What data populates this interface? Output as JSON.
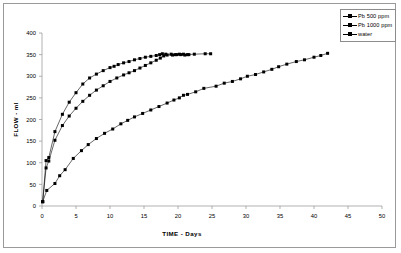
{
  "chart_data": {
    "type": "line",
    "title": "",
    "xlabel": "TIME  -  Days",
    "ylabel": "FLOW - ml",
    "xlim": [
      0,
      50
    ],
    "ylim": [
      0,
      400
    ],
    "xticks": [
      0,
      5,
      10,
      15,
      20,
      25,
      30,
      35,
      40,
      45,
      50
    ],
    "yticks": [
      0,
      50,
      100,
      150,
      200,
      250,
      300,
      350,
      400
    ],
    "grid": false,
    "legend_position": "top-right",
    "marker": "filled-square",
    "line_color": "#000000",
    "series": [
      {
        "name": "Pb 500 ppm",
        "points": [
          [
            0.1,
            10
          ],
          [
            0.6,
            105
          ],
          [
            1.0,
            112
          ],
          [
            1.9,
            172
          ],
          [
            3.0,
            212
          ],
          [
            4.0,
            240
          ],
          [
            5.0,
            262
          ],
          [
            6.0,
            282
          ],
          [
            7.0,
            296
          ],
          [
            8.0,
            305
          ],
          [
            9.0,
            313
          ],
          [
            10.0,
            320
          ],
          [
            10.6,
            323
          ],
          [
            11.2,
            327
          ],
          [
            12.0,
            331
          ],
          [
            12.8,
            334
          ],
          [
            13.6,
            338
          ],
          [
            14.4,
            341
          ],
          [
            15.2,
            344
          ],
          [
            16.0,
            346
          ],
          [
            16.8,
            348
          ],
          [
            17.3,
            350
          ],
          [
            17.7,
            352
          ],
          [
            18.2,
            351
          ],
          [
            19.0,
            351
          ],
          [
            19.6,
            350
          ],
          [
            20.2,
            351
          ],
          [
            20.8,
            351
          ],
          [
            21.4,
            350
          ],
          [
            22.4,
            351
          ],
          [
            24.0,
            352
          ],
          [
            24.8,
            352
          ]
        ]
      },
      {
        "name": "Pb 1000 ppm",
        "points": [
          [
            0.1,
            10
          ],
          [
            0.6,
            88
          ],
          [
            1.0,
            104
          ],
          [
            1.9,
            152
          ],
          [
            3.0,
            186
          ],
          [
            4.0,
            208
          ],
          [
            5.0,
            226
          ],
          [
            6.0,
            242
          ],
          [
            7.0,
            256
          ],
          [
            8.0,
            268
          ],
          [
            9.0,
            278
          ],
          [
            10.0,
            288
          ],
          [
            11.0,
            296
          ],
          [
            12.0,
            303
          ],
          [
            12.8,
            308
          ],
          [
            13.6,
            313
          ],
          [
            14.4,
            319
          ],
          [
            15.2,
            325
          ],
          [
            16.0,
            331
          ],
          [
            16.8,
            337
          ],
          [
            17.4,
            342
          ],
          [
            17.9,
            347
          ],
          [
            18.4,
            349
          ],
          [
            19.2,
            349
          ],
          [
            19.8,
            350
          ],
          [
            20.4,
            350
          ],
          [
            21.0,
            349
          ],
          [
            21.6,
            350
          ]
        ]
      },
      {
        "name": "water",
        "points": [
          [
            0.1,
            10
          ],
          [
            0.7,
            36
          ],
          [
            1.9,
            52
          ],
          [
            2.6,
            70
          ],
          [
            3.4,
            84
          ],
          [
            4.6,
            110
          ],
          [
            5.8,
            128
          ],
          [
            6.8,
            142
          ],
          [
            8.0,
            156
          ],
          [
            9.2,
            168
          ],
          [
            10.4,
            178
          ],
          [
            11.6,
            190
          ],
          [
            12.6,
            198
          ],
          [
            13.6,
            206
          ],
          [
            14.8,
            214
          ],
          [
            16.0,
            222
          ],
          [
            17.2,
            230
          ],
          [
            18.4,
            238
          ],
          [
            19.4,
            245
          ],
          [
            20.2,
            250
          ],
          [
            20.8,
            256
          ],
          [
            21.4,
            258
          ],
          [
            22.6,
            264
          ],
          [
            23.8,
            272
          ],
          [
            25.6,
            277
          ],
          [
            26.8,
            284
          ],
          [
            28.0,
            288
          ],
          [
            29.2,
            294
          ],
          [
            30.2,
            300
          ],
          [
            31.4,
            304
          ],
          [
            32.6,
            310
          ],
          [
            33.8,
            316
          ],
          [
            34.8,
            322
          ],
          [
            36.0,
            328
          ],
          [
            37.4,
            334
          ],
          [
            38.6,
            338
          ],
          [
            40.0,
            344
          ],
          [
            41.0,
            348
          ],
          [
            42.0,
            353
          ]
        ]
      }
    ]
  },
  "legend": {
    "items": [
      {
        "label": "Pb 500 ppm"
      },
      {
        "label": "Pb 1000 ppm"
      },
      {
        "label": "water"
      }
    ]
  }
}
